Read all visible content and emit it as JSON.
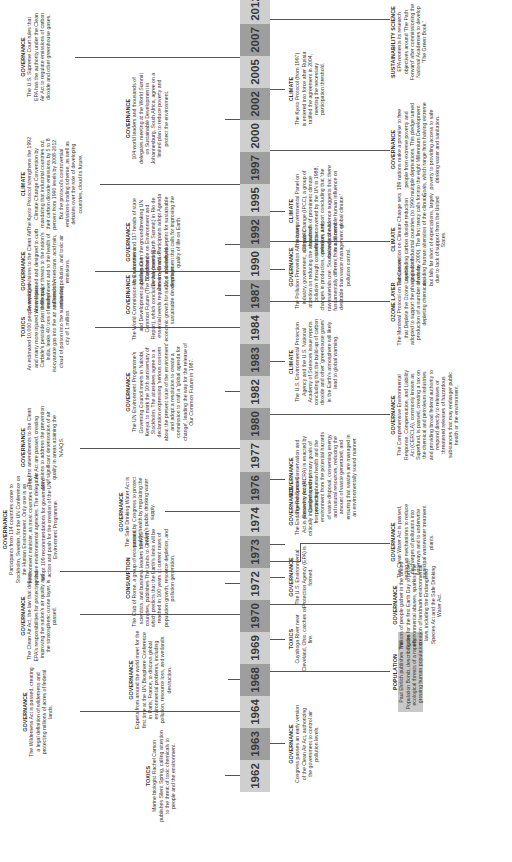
{
  "timeline": {
    "years": [
      "1962",
      "1963",
      "1964",
      "1968",
      "1969",
      "1970",
      "1972",
      "1973",
      "1974",
      "1976",
      "1977",
      "1980",
      "1982",
      "1983",
      "1984",
      "1987",
      "1990",
      "1992",
      "1995",
      "1997",
      "2000",
      "2002",
      "2005",
      "2007",
      "2012"
    ],
    "events_above": [
      {
        "year": "1962",
        "category": "TOXICS",
        "text": "Marine biologist Rachel Carson publishes Silent Spring, calling attention to the threat of toxic chemicals to people and the environment."
      },
      {
        "year": "1964",
        "category": "GOVERNANCE",
        "text": "The Wilderness Act is passed, creating a legal definition of wilderness and protecting millions of acres of federal lands."
      },
      {
        "year": "1968",
        "category": "GOVERNANCE",
        "text": "Experts from around the world meet for the first time at the UN Biosphere Conference in Paris, France, to discuss global environmental problems, including pollution, resource loss, and wetlands destruction."
      },
      {
        "year": "1970",
        "category": "GOVERNANCE",
        "text": "The Clean Air Act, the law that defines EPA's responsibilities for protecting and improving the nation's air quality and the stratospheric ozone layer, is passed."
      },
      {
        "year": "1972",
        "category": "CONSUMPTION",
        "text": "The Club of Rome, a group of economists, scientists, and business leaders from 25 countries, publishes The Limits to Growth, which predicts that the Earth's limits will be reached in 100 years at current rates of population growth, resource depletion, and pollution generation."
      },
      {
        "year": "1972b",
        "category": "GOVERNANCE",
        "text": "Participants from 114 countries come to Stockholm, Sweden, for the UN Conference on the Human Environment. Only one is an environment minister, as most countries do not yet have environmental agencies. The delegates adopt 109 recommendations for government action and push for the creation of the UN Environment Programme."
      },
      {
        "year": "1974",
        "category": "GOVERNANCE",
        "text": "The Safe Drinking Water Act is passed by Congress to protect public health by regulating the nation's public drinking water supply."
      },
      {
        "year": "1977",
        "category": "GOVERNANCE",
        "text": "The first amendments to the Clean Air Act are passed, creating provisions to address the prevention of significant deterioration of air quality in areas attaining the NAAQS."
      },
      {
        "year": "1982",
        "category": "GOVERNANCE",
        "text": "The UN Environment Programme's Governing Council meets in Nairobi, Kenya, to mark the 10th anniversary of Stockholm. The attendees agree to a declaration expressing 'serious concern about the present state of the environment' and adopt a resolution to create a commission to craft a 'global agenda for change', leading the way for the release of Our Common Future in 1987."
      },
      {
        "year": "1984",
        "category": "TOXICS",
        "text": "An estimated 10,000 people are killed and many more injured when Union Carbide's pesticide plant in Bhopal, India, leaks 40 tons of methyl isocyanate gas into the air and sends a cloud of poison into the surrounding city of 1 million."
      },
      {
        "year": "1987",
        "category": "GOVERNANCE",
        "text": "The World Commission on Environment and Development publishes Our Common Future (The Brundtland Report), which concludes that 'meeting essential needs requires a new era of economic growth for nations' and defines sustainable development."
      },
      {
        "year": "1990",
        "category": "GOVERNANCE",
        "text": "Sweeping revisions to the Clean Air Act are passed and designed to curb three major threats to the nation's environment and to the health of millions of Americans: acid rain, urban air pollution, and toxic air emissions."
      },
      {
        "year": "1992",
        "category": "GOVERNANCE",
        "text": "Most countries and 117 heads of state participate in the groundbreaking UN Conference on Environment and Development (Earth Summit) in Rio de Janeiro, Brazil. Participants adopt Agenda 21, a voluntary blueprint for sustainable development that calls for improving the quality of life on Earth."
      },
      {
        "year": "1997",
        "category": "CLIMATE",
        "text": "The Kyoto Protocol strengthens the 1992 Climate Change Convention by mandating that industrial countries cut their carbon dioxide emissions by 5 to 8 percent from 1990 levels by 2008-2012. But the protocol's controversial emissions-trading scheme, as well as debates over the role of developing countries, cloud its future."
      },
      {
        "year": "2002",
        "category": "GOVERNANCE",
        "text": "104 world leaders and thousands of delegates meeting at the World Summit on Sustainable Development in Johannesburg, South Africa, agree on a limited plan to reduce poverty and protect the environment."
      },
      {
        "year": "2007",
        "category": "GOVERNANCE",
        "text": "The U.S. Supreme Court rules that EPA has the authority under the Clean Air Act to regulate emissions of carbon dioxide and other greenhouse gases."
      }
    ],
    "events_below": [
      {
        "year": "1963",
        "category": "GOVERNANCE",
        "text": "Congress passes an early version of the Clean Air Act, authorizing the government to control air pollution levels."
      },
      {
        "year": "1968",
        "category": "POPULATION",
        "text": "Paul Ehrlich publishes The Population Bomb, describing the ecological threats of a rapidly growing human population.",
        "highlight": true
      },
      {
        "year": "1969",
        "category": "TOXICS",
        "text": "Cuyahoga River near Cleveland, Ohio, catches on fire."
      },
      {
        "year": "1970",
        "category": "GOVERNANCE",
        "text": "Millions of people gather in the United States for the first Earth Day to protest environmental abuses, sparking the creation of landmark environmental laws, including the Endangered Species Act and the Safe Drinking Water Act."
      },
      {
        "year": "1970b",
        "category": "GOVERNANCE",
        "text": "The U.S. Environmental Protection Agency (EPA) is formed."
      },
      {
        "year": "1972",
        "category": "GOVERNANCE",
        "text": "The Clean Water Act is passed, setting up mechanisms to reduce discharges of pollutants into waterways and to underwrite municipal wastewater treatment plants."
      },
      {
        "year": "1973",
        "category": "GOVERNANCE",
        "text": "The Endangered Species Act is passed to protect critically imperiled species from extinction."
      },
      {
        "year": "1976",
        "category": "GOVERNANCE",
        "text": "The Resource Conservation and Recovery Act (RCRA) is enacted by Congress with primary goals of protecting human health and the environment from the potential hazards of waste disposal, conserving energy and natural resources, reducing the amount of waste generated, and ensuring that wastes are managed in an environmentally sound manner."
      },
      {
        "year": "1980",
        "category": "GOVERNANCE",
        "text": "The Comprehensive Environmental Response, Compensation, and Liability Act (CERCLA), commonly known as Superfund, is passed, creating a tax on the chemical and petroleum industries and providing broad federal authority to respond directly to releases or threatened releases of hazardous substances that may endanger public health or the environment."
      },
      {
        "year": "1983",
        "category": "CLIMATE",
        "text": "The U.S. Environmental Protection Agency and the U.S. National Academy of Sciences issue reports concluding that the build-up of carbon dioxide and other 'greenhouse gases' in the Earth's atmosphere will likely lead to global warming."
      },
      {
        "year": "1987",
        "category": "OZONE LAYER",
        "text": "The Montreal Protocol on Substances that Deplete the Ozone Layer is adopted to support the phasing out of production of a number of ozone-depleting chemicals."
      },
      {
        "year": "1990",
        "category": "GOVERNANCE",
        "text": "The Pollution Prevention Act focuses industry, government, and public attention on reducing the amount of pollution through cost-effective changes in production, operation, and raw materials use. Source reduction is fundamentally different from and more desirable than waste management or pollution control."
      },
      {
        "year": "1992",
        "category": "CLIMATE",
        "text": "The Convention on Climate Change sets nonbinding carbon dioxide reduction goals for industrial countries (to 1990 levels by 2000). The first treaty calls for avoiding human alteration of the climate, but falls far short of expectations, largely due to lack of support from the United States."
      },
      {
        "year": "1995",
        "category": "CLIMATE",
        "text": "The Intergovernmental Panel on Climate Change (IPCC), a group of hundreds of prominent climate scientists convened by the UN in 1988, releases a report concluding that 'the balance of evidence suggests that there is a discernible human influence on global climate.'"
      },
      {
        "year": "2000",
        "category": "GOVERNANCE",
        "text": "189 nations make a promise to free people from extreme poverty and multiple deprivations. This pledge turned into the eight Millennium Development Goals, which range from halving extreme poverty to providing access to safe drinking water and sanitation."
      },
      {
        "year": "2005",
        "category": "CLIMATE",
        "text": "The Kyoto Protocol (from 1997) is entered into force after Russia ratified the agreement in 2004, meeting the necessary participation threshold."
      },
      {
        "year": "2012",
        "category": "SUSTAINABILITY SCIENCE",
        "text": "EPA reorients its research objectives around 'The Path Forward' after commissioning the National Academies to develop 'The Green Book.'"
      }
    ]
  },
  "colors": {
    "axis_dark": "#9e9e9e",
    "axis_light": "#cfcfcf",
    "line": "#555555",
    "text": "#333333"
  }
}
